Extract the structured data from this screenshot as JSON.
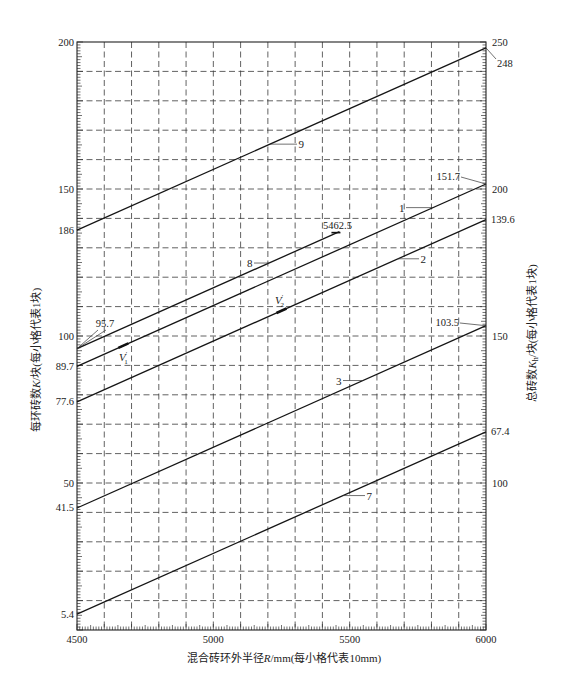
{
  "chart_data": {
    "type": "line",
    "title": "",
    "xlabel": {
      "pre": "混合砖环外半径",
      "var": "R",
      "post": "/mm(每小格代表10mm)"
    },
    "ylabel_left": {
      "pre": "每环砖数",
      "var": "K",
      "post": "/块(每小格代表1块)"
    },
    "ylabel_right": {
      "pre": "总砖数",
      "var": "K",
      "sub": "h",
      "post": "/块(每小格代表1块)"
    },
    "x_axis": {
      "range": [
        4500,
        6000
      ],
      "tick_labels": [
        4500,
        5000,
        5500,
        6000
      ],
      "minor_step": 10,
      "grid_step": 100
    },
    "y_axis_left": {
      "range": [
        0,
        200
      ],
      "tick_labels": [
        50,
        100,
        150,
        200
      ],
      "minor_step": 1,
      "grid_step": 10
    },
    "y_axis_right": {
      "range": [
        50,
        250
      ],
      "tick_labels": [
        100,
        150,
        200,
        250
      ],
      "minor_step": 1
    },
    "grid": true,
    "legend": "none",
    "series": [
      {
        "name": "9",
        "axis": "right",
        "x": [
          4500,
          6000
        ],
        "y": [
          186,
          248
        ]
      },
      {
        "name": "8",
        "axis": "left",
        "x": [
          4500,
          5462.5
        ],
        "y": [
          95.7,
          135.5
        ]
      },
      {
        "name": "1",
        "axis": "left",
        "x": [
          4500,
          6000
        ],
        "y": [
          89.7,
          151.7
        ]
      },
      {
        "name": "2",
        "axis": "left",
        "x": [
          4500,
          6000
        ],
        "y": [
          77.6,
          139.6
        ]
      },
      {
        "name": "3",
        "axis": "left",
        "x": [
          4500,
          6000
        ],
        "y": [
          41.5,
          103.5
        ]
      },
      {
        "name": "7",
        "axis": "left",
        "x": [
          4500,
          6000
        ],
        "y": [
          5.4,
          67.4
        ]
      }
    ],
    "markers": [
      {
        "series": "1",
        "x": 4670,
        "symbol": "V",
        "sup": "′",
        "sub": "1"
      },
      {
        "series": "2",
        "x": 5250,
        "symbol": "V",
        "sup": "′",
        "sub": "2"
      }
    ],
    "annotations": [
      {
        "text": "186",
        "series": "9",
        "point": "start"
      },
      {
        "text": "95.7",
        "series": "8",
        "point": "start"
      },
      {
        "text": "89.7",
        "series": "1",
        "point": "start"
      },
      {
        "text": "77.6",
        "series": "2",
        "point": "start"
      },
      {
        "text": "41.5",
        "series": "3",
        "point": "start"
      },
      {
        "text": "5.4",
        "series": "7",
        "point": "start"
      },
      {
        "text": "248",
        "series": "9",
        "point": "end"
      },
      {
        "text": "151.7",
        "series": "1",
        "point": "end"
      },
      {
        "text": "139.6",
        "series": "2",
        "point": "end"
      },
      {
        "text": "103.5",
        "series": "3",
        "point": "end"
      },
      {
        "text": "67.4",
        "series": "7",
        "point": "end"
      },
      {
        "text": "5462.5",
        "series": "8",
        "point": "end"
      }
    ]
  }
}
